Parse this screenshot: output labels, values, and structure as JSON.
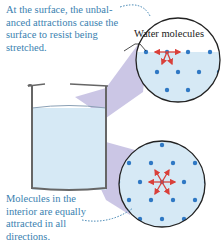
{
  "captions": {
    "surface": "At the surface, the unbal­anced attractions cause the surface to resist being stretched.",
    "interior": "Molecules in the interior are equally attracted in all directions."
  },
  "labels": {
    "water_molecules": "Water molecules"
  },
  "colors": {
    "caption_text": "#3a7fb0",
    "molecule": "#2f78c4",
    "arrow": "#d9403a",
    "water": "#d6e9f5",
    "beam": "#b9b3dc",
    "outline": "#222222"
  }
}
